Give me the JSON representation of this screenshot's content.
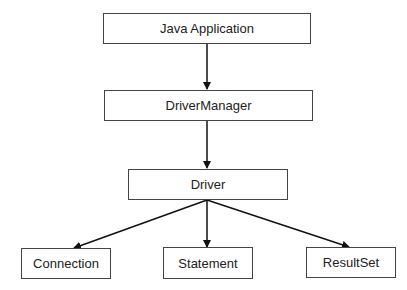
{
  "diagram": {
    "nodes": [
      {
        "id": "java_app",
        "label": "Java Application"
      },
      {
        "id": "driver_manager",
        "label": "DriverManager"
      },
      {
        "id": "driver",
        "label": "Driver"
      },
      {
        "id": "connection",
        "label": "Connection"
      },
      {
        "id": "statement",
        "label": "Statement"
      },
      {
        "id": "resultset",
        "label": "ResultSet"
      }
    ],
    "edges": [
      {
        "from": "java_app",
        "to": "driver_manager"
      },
      {
        "from": "driver_manager",
        "to": "driver"
      },
      {
        "from": "driver",
        "to": "connection"
      },
      {
        "from": "driver",
        "to": "statement"
      },
      {
        "from": "driver",
        "to": "resultset"
      }
    ]
  }
}
